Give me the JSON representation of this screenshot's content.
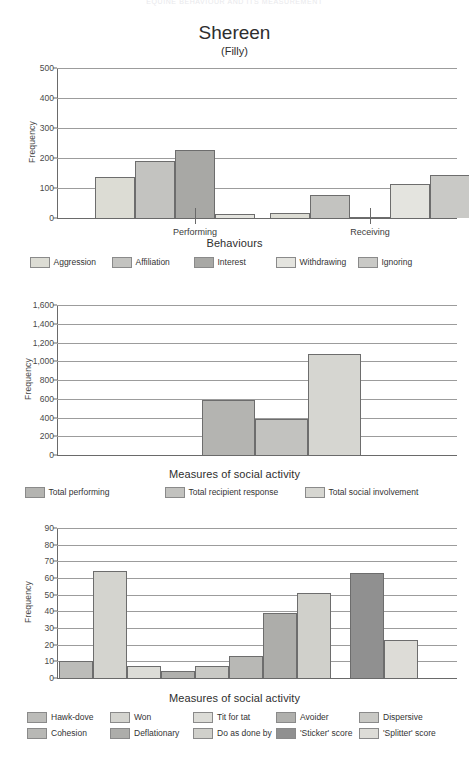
{
  "document": {
    "topline": "EQUINE BEHAVIOUR AND ITS MEASUREMENT"
  },
  "title": {
    "main": "Shereen",
    "sub": "(Filly)"
  },
  "colors": {
    "aggression": "#dcdcd4",
    "affiliation": "#c3c3c0",
    "interest": "#a8a8a5",
    "withdrawing": "#e4e4df",
    "ignoring": "#c9c9c6",
    "total_performing": "#b4b4b1",
    "total_recipient_response": "#c2c2bf",
    "total_social_involvement": "#d6d6d1",
    "hawk_dove": "#bcbcb9",
    "won": "#d4d4cf",
    "tit_for_tat": "#dcdcd7",
    "avoider": "#b0b0ad",
    "dispersive": "#c9c9c5",
    "cohesion": "#b8b8b5",
    "deflationary": "#adadaa",
    "do_as_done_by": "#d0d0cb",
    "sticker_score": "#909090",
    "splitter_score": "#dddcd7",
    "gridline": "#9c9c9c",
    "axis": "#6a6a6a",
    "bar_border": "#6d6d6d",
    "text": "#333333"
  },
  "chart_data": [
    {
      "id": "chart-behaviours",
      "type": "bar",
      "title": "Shereen",
      "subtitle": "(Filly)",
      "xlabel": "Behaviours",
      "ylabel": "Frequency",
      "ylim": [
        0,
        500
      ],
      "yticks": [
        0,
        100,
        200,
        300,
        400,
        500
      ],
      "ytick_labels": [
        "0",
        "100",
        "200",
        "300",
        "400",
        "500"
      ],
      "grid": true,
      "legend_position": "bottom",
      "categories": [
        "Performing",
        "Receiving"
      ],
      "series": [
        {
          "name": "Aggression",
          "color_key": "aggression",
          "values": [
            137,
            16
          ]
        },
        {
          "name": "Affiliation",
          "color_key": "affiliation",
          "values": [
            190,
            77
          ]
        },
        {
          "name": "Interest",
          "color_key": "interest",
          "values": [
            228,
            5
          ]
        },
        {
          "name": "Withdrawing",
          "color_key": "withdrawing",
          "values": [
            14,
            114
          ]
        },
        {
          "name": "Ignoring",
          "color_key": "ignoring",
          "values": [
            0,
            145
          ]
        }
      ],
      "legend": [
        {
          "label": "Aggression",
          "color_key": "aggression"
        },
        {
          "label": "Affiliation",
          "color_key": "affiliation"
        },
        {
          "label": "Interest",
          "color_key": "interest"
        },
        {
          "label": "Withdrawing",
          "color_key": "withdrawing"
        },
        {
          "label": "Ignoring",
          "color_key": "ignoring"
        }
      ]
    },
    {
      "id": "chart-social-activity-totals",
      "type": "bar",
      "xlabel": "Measures of social activity",
      "ylabel": "Frequency",
      "ylim": [
        0,
        1600
      ],
      "yticks": [
        0,
        200,
        400,
        600,
        800,
        1000,
        1200,
        1400,
        1600
      ],
      "ytick_labels": [
        "0",
        "200",
        "400",
        "600",
        "800",
        "1,000",
        "1,200",
        "1,400",
        "1,600"
      ],
      "grid": true,
      "legend_position": "bottom",
      "categories": [
        "Total performing",
        "Total recipient response",
        "Total social involvement"
      ],
      "values": [
        590,
        385,
        1080
      ],
      "bar_colors": [
        "total_performing",
        "total_recipient_response",
        "total_social_involvement"
      ],
      "legend": [
        {
          "label": "Total performing",
          "color_key": "total_performing"
        },
        {
          "label": "Total recipient response",
          "color_key": "total_recipient_response"
        },
        {
          "label": "Total social involvement",
          "color_key": "total_social_involvement"
        }
      ]
    },
    {
      "id": "chart-social-activity-measures",
      "type": "bar",
      "xlabel": "Measures of social activity",
      "ylabel": "Frequency",
      "ylim": [
        0,
        90
      ],
      "yticks": [
        0,
        10,
        20,
        30,
        40,
        50,
        60,
        70,
        80,
        90
      ],
      "ytick_labels": [
        "0",
        "10",
        "20",
        "30",
        "40",
        "50",
        "60",
        "70",
        "80",
        "90"
      ],
      "grid": true,
      "legend_position": "bottom",
      "categories": [
        "Hawk-dove",
        "Won",
        "Tit for tat",
        "Avoider",
        "Dispersive",
        "Cohesion",
        "Deflationary",
        "Do as done by",
        "'Sticker' score",
        "'Splitter' score"
      ],
      "values": [
        10,
        64,
        7,
        4.5,
        7,
        13,
        39,
        51,
        63,
        23
      ],
      "bar_colors": [
        "hawk_dove",
        "won",
        "tit_for_tat",
        "avoider",
        "dispersive",
        "cohesion",
        "deflationary",
        "do_as_done_by",
        "sticker_score",
        "splitter_score"
      ],
      "legend": [
        {
          "label": "Hawk-dove",
          "color_key": "hawk_dove"
        },
        {
          "label": "Won",
          "color_key": "won"
        },
        {
          "label": "Tit for tat",
          "color_key": "tit_for_tat"
        },
        {
          "label": "Avoider",
          "color_key": "avoider"
        },
        {
          "label": "Dispersive",
          "color_key": "dispersive"
        },
        {
          "label": "Cohesion",
          "color_key": "cohesion"
        },
        {
          "label": "Deflationary",
          "color_key": "deflationary"
        },
        {
          "label": "Do as done by",
          "color_key": "do_as_done_by"
        },
        {
          "label": "'Sticker' score",
          "color_key": "sticker_score"
        },
        {
          "label": "'Splitter' score",
          "color_key": "splitter_score"
        }
      ]
    }
  ]
}
